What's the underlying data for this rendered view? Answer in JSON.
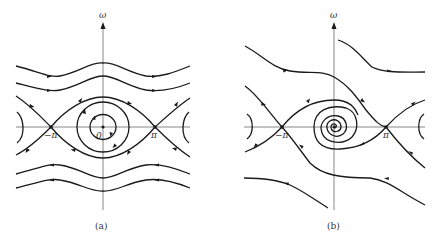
{
  "figure": {
    "panel_a": {
      "caption": "(a)",
      "y_axis_label": "ω",
      "origin_label": "0",
      "tick_neg_pi": "−π",
      "tick_pi": "π",
      "description": "Undamped pendulum phase portrait: center at origin with closed orbits, saddles at ±π joined by separatrices, rotating trajectories above (rightward) and below (leftward)."
    },
    "panel_b": {
      "caption": "(b)",
      "y_axis_label": "ω",
      "tick_neg_pi": "−π",
      "tick_pi": "π",
      "description": "Damped pendulum phase portrait: stable spiral at origin, saddles at ±π, trajectories spiraling inward."
    }
  }
}
